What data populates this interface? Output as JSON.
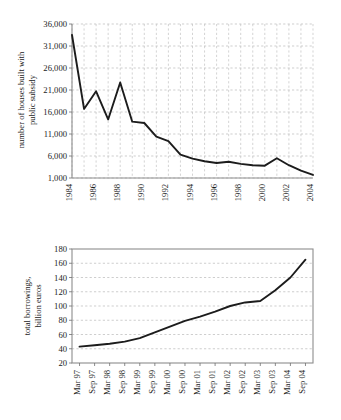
{
  "chart_data": [
    {
      "type": "line",
      "id": "houses-built-with-public-subsidy",
      "title": "",
      "xlabel": "",
      "ylabel": "number of houses built with\npublic subsidy",
      "ylabel_line1": "number of houses built with",
      "ylabel_line2": "public subsidy",
      "ylim": [
        1000,
        36000
      ],
      "ytick_values": [
        1000,
        6000,
        11000,
        16000,
        21000,
        26000,
        31000,
        36000
      ],
      "ytick_labels": [
        "1,000",
        "6,000",
        "11,000",
        "16,000",
        "21,000",
        "26,000",
        "31,000",
        "36,000"
      ],
      "xlim": [
        1984,
        2004
      ],
      "xtick_labels": [
        "1984",
        "1986",
        "1988",
        "1990",
        "1992",
        "1994",
        "1996",
        "1998",
        "2000",
        "2002",
        "2004"
      ],
      "xtick_values": [
        1984,
        1986,
        1988,
        1990,
        1992,
        1994,
        1996,
        1998,
        2000,
        2002,
        2004
      ],
      "grid": "both-dashed",
      "legend": "none",
      "x": [
        1984,
        1985,
        1986,
        1987,
        1988,
        1989,
        1990,
        1991,
        1992,
        1993,
        1994,
        1995,
        1996,
        1997,
        1998,
        1999,
        2000,
        2001,
        2002,
        2003,
        2004
      ],
      "values": [
        33500,
        16700,
        20700,
        14300,
        22700,
        13800,
        13500,
        10400,
        9400,
        6300,
        5400,
        4800,
        4400,
        4700,
        4200,
        3900,
        3800,
        5500,
        3900,
        2700,
        1700
      ]
    },
    {
      "type": "line",
      "id": "total-borrowings",
      "title": "",
      "xlabel": "",
      "ylabel": "total borrowings,\nbillion euros",
      "ylabel_line1": "total borrowings,",
      "ylabel_line2": "billion euros",
      "ylim": [
        20,
        180
      ],
      "ytick_values": [
        20,
        40,
        60,
        80,
        100,
        120,
        140,
        160,
        180
      ],
      "ytick_labels": [
        "20",
        "40",
        "60",
        "80",
        "100",
        "120",
        "140",
        "160",
        "180"
      ],
      "xtick_labels": [
        "Mar 97",
        "Sep 97",
        "Mar 98",
        "Sep 98",
        "Mar 99",
        "Sep 99",
        "Mar 00",
        "Sep 00",
        "Mar 01",
        "Sep 01",
        "Mar 02",
        "Sep 02",
        "Mar 03",
        "Sep 03",
        "Mar 04",
        "Sep 04"
      ],
      "grid": "horizontal-dashed",
      "legend": "none",
      "x": [
        "Mar 97",
        "Sep 97",
        "Mar 98",
        "Sep 98",
        "Mar 99",
        "Sep 99",
        "Mar 00",
        "Sep 00",
        "Mar 01",
        "Sep 01",
        "Mar 02",
        "Sep 02",
        "Mar 03",
        "Sep 03",
        "Mar 04",
        "Sep 04"
      ],
      "values": [
        43,
        45,
        47,
        50,
        55,
        63,
        71,
        79,
        85,
        92,
        100,
        105,
        107,
        122,
        140,
        165
      ]
    }
  ]
}
